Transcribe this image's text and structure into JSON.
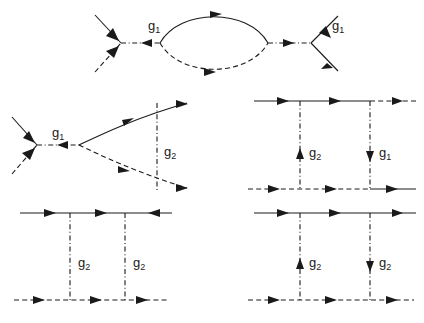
{
  "figure": {
    "background_color": "#ffffff",
    "line_color": "#1a1a1a",
    "labels": {
      "g1": "g",
      "g1_sub": "1",
      "g2": "g",
      "g2_sub": "2"
    }
  },
  "diagrams": [
    {
      "id": "top-bubble",
      "name": "bubble-diagram",
      "description": "Two four-point vertices joined by a particle-hole bubble loop",
      "vertex_labels": [
        "g1",
        "g1"
      ],
      "label_positions": [
        {
          "x": 152,
          "y": 30
        },
        {
          "x": 336,
          "y": 30
        }
      ],
      "loop": {
        "upper_line": "solid",
        "lower_line": "dashed",
        "upper_arrow": "right",
        "lower_arrow": "right"
      },
      "legs": [
        {
          "side": "left-upper",
          "style": "solid",
          "arrow": "in"
        },
        {
          "side": "left-lower",
          "style": "dashed",
          "arrow": "in"
        },
        {
          "side": "right-upper",
          "style": "solid",
          "arrow": "out"
        },
        {
          "side": "right-lower",
          "style": "solid",
          "arrow": "out"
        }
      ],
      "internal_line": {
        "style": "dashdot",
        "left_arrow": "right",
        "right_arrow": "left"
      }
    },
    {
      "id": "mid-left-vertex-correction",
      "name": "vertex-correction-diagram",
      "description": "g1 vertex joined to a pair of curved propagators bridged by a g2 interaction line",
      "vertex_labels": [
        "g1",
        "g2"
      ],
      "label_positions": [
        {
          "x": 56,
          "y": 137
        },
        {
          "x": 167,
          "y": 152
        }
      ],
      "legs": [
        {
          "side": "left-upper",
          "style": "solid",
          "arrow": "in"
        },
        {
          "side": "left-lower",
          "style": "dashed",
          "arrow": "in"
        }
      ],
      "internal_line": {
        "style": "dashdot",
        "arrow": "left"
      },
      "arcs": {
        "upper": "solid",
        "lower": "dashed",
        "upper_arrow": "right",
        "lower_arrow": "right"
      },
      "bridge": {
        "style": "dashdot",
        "arrow": "none"
      }
    },
    {
      "id": "mid-right-ladder",
      "name": "ladder-diagram-g2-g1",
      "description": "Ladder box with an upward g2 rung and a downward g1 rung",
      "vertex_labels": [
        "g2",
        "g1"
      ],
      "label_positions": [
        {
          "x": 315,
          "y": 152
        },
        {
          "x": 385,
          "y": 152
        }
      ],
      "top_line": {
        "left_segment": "solid",
        "right_segment": "dashed",
        "arrows": [
          "right",
          "right",
          "right"
        ]
      },
      "bottom_line": {
        "left_segment": "dashed",
        "right_segment": "solid",
        "arrows": [
          "right",
          "right",
          "right"
        ]
      },
      "rungs": [
        {
          "label": "g2",
          "style": "dashdot",
          "arrow": "up"
        },
        {
          "label": "g1",
          "style": "dashdot",
          "arrow": "down"
        }
      ]
    },
    {
      "id": "bottom-left-ladder",
      "name": "ladder-diagram-g2-g2-crossed",
      "description": "Ladder box with two g2 rungs, solid top line with a back-pointing arrow",
      "vertex_labels": [
        "g2",
        "g2"
      ],
      "label_positions": [
        {
          "x": 85,
          "y": 262
        },
        {
          "x": 143,
          "y": 262
        }
      ],
      "top_line": {
        "left_segment": "solid",
        "right_segment": "solid",
        "arrows": [
          "right",
          "right",
          "left"
        ]
      },
      "bottom_line": {
        "left_segment": "dashed",
        "right_segment": "dashed",
        "arrows": [
          "right",
          "right",
          "right"
        ]
      },
      "rungs": [
        {
          "label": "g2",
          "style": "dashdot",
          "arrow": "none"
        },
        {
          "label": "g2",
          "style": "dashdot",
          "arrow": "none"
        }
      ]
    },
    {
      "id": "bottom-right-ladder",
      "name": "ladder-diagram-g2-g2",
      "description": "Ladder box with an upward g2 rung and a downward g2 rung",
      "vertex_labels": [
        "g2",
        "g2"
      ],
      "label_positions": [
        {
          "x": 315,
          "y": 262
        },
        {
          "x": 385,
          "y": 262
        }
      ],
      "top_line": {
        "left_segment": "solid",
        "right_segment": "solid",
        "arrows": [
          "right",
          "right",
          "right"
        ]
      },
      "bottom_line": {
        "left_segment": "dashed",
        "right_segment": "dashed",
        "arrows": [
          "right",
          "right",
          "right"
        ]
      },
      "rungs": [
        {
          "label": "g2",
          "style": "dashdot",
          "arrow": "up"
        },
        {
          "label": "g2",
          "style": "dashdot",
          "arrow": "down"
        }
      ]
    }
  ]
}
